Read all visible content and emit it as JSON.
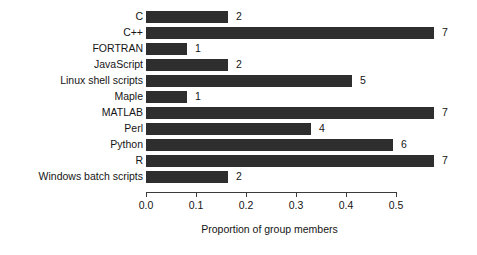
{
  "chart_data": {
    "type": "bar",
    "orientation": "horizontal",
    "title": "",
    "xlabel": "Proportion of group members",
    "ylabel": "",
    "xlim": [
      0.0,
      0.58
    ],
    "xticks": [
      "0.0",
      "0.1",
      "0.2",
      "0.3",
      "0.4",
      "0.5"
    ],
    "xtick_values": [
      0.0,
      0.1,
      0.2,
      0.3,
      0.4,
      0.5
    ],
    "grid": false,
    "legend": null,
    "bar_color": "#2e2e2e",
    "background_color": "#ffffff",
    "categories": [
      "C",
      "C++",
      "FORTRAN",
      "JavaScript",
      "Linux shell scripts",
      "Maple",
      "MATLAB",
      "Perl",
      "Python",
      "R",
      "Windows batch scripts"
    ],
    "values": [
      0.164,
      0.576,
      0.082,
      0.164,
      0.412,
      0.082,
      0.576,
      0.33,
      0.494,
      0.576,
      0.164
    ],
    "data_labels": [
      "2",
      "7",
      "1",
      "2",
      "5",
      "1",
      "7",
      "4",
      "6",
      "7",
      "2"
    ],
    "bars": [
      {
        "category": "C",
        "value": 0.164,
        "label": "2"
      },
      {
        "category": "C++",
        "value": 0.576,
        "label": "7"
      },
      {
        "category": "FORTRAN",
        "value": 0.082,
        "label": "1"
      },
      {
        "category": "JavaScript",
        "value": 0.164,
        "label": "2"
      },
      {
        "category": "Linux shell scripts",
        "value": 0.412,
        "label": "5"
      },
      {
        "category": "Maple",
        "value": 0.082,
        "label": "1"
      },
      {
        "category": "MATLAB",
        "value": 0.576,
        "label": "7"
      },
      {
        "category": "Perl",
        "value": 0.33,
        "label": "4"
      },
      {
        "category": "Python",
        "value": 0.494,
        "label": "6"
      },
      {
        "category": "R",
        "value": 0.576,
        "label": "7"
      },
      {
        "category": "Windows batch scripts",
        "value": 0.164,
        "label": "2"
      }
    ]
  }
}
